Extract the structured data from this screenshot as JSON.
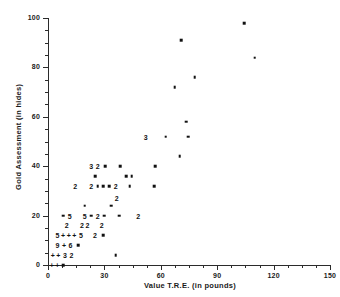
{
  "chart_data": {
    "type": "scatter",
    "title": "",
    "xlabel": "Value T.R.E. (in pounds)",
    "ylabel": "Gold Assessment (in hides)",
    "xlim": [
      0,
      150
    ],
    "ylim": [
      0,
      100
    ],
    "xticks": [
      0,
      30,
      60,
      90,
      120,
      150
    ],
    "yticks": [
      0,
      20,
      40,
      60,
      80,
      100
    ],
    "xtick_labels": [
      "0",
      "30",
      "60",
      "90",
      "120",
      "150"
    ],
    "ytick_labels": [
      "0",
      "20",
      "40",
      "60",
      "80",
      "100"
    ],
    "xminor_step": 7.5,
    "yminor_step": 5,
    "grid": false,
    "legend": null,
    "marker_note": "Digits and '+' glyphs mark positions where multiple observations coincide; a digit is the count of overlapping points and '+' marks a dense overlap.",
    "points": [
      {
        "x": 104.5,
        "y": 98,
        "label": "",
        "marker": "dot"
      },
      {
        "x": 71.0,
        "y": 91,
        "label": "",
        "marker": "dot"
      },
      {
        "x": 110.0,
        "y": 84,
        "label": "",
        "marker": "dot"
      },
      {
        "x": 78.0,
        "y": 76,
        "label": "",
        "marker": "dot"
      },
      {
        "x": 67.5,
        "y": 72,
        "label": "",
        "marker": "dot"
      },
      {
        "x": 73.5,
        "y": 58,
        "label": "",
        "marker": "dot"
      },
      {
        "x": 62.5,
        "y": 52,
        "label": "",
        "marker": "dot"
      },
      {
        "x": 74.5,
        "y": 52,
        "label": "",
        "marker": "dot"
      },
      {
        "x": 52.0,
        "y": 52,
        "label": "3",
        "marker": "count"
      },
      {
        "x": 70.0,
        "y": 44,
        "label": "",
        "marker": "dot"
      },
      {
        "x": 57.0,
        "y": 40,
        "label": "",
        "marker": "dot"
      },
      {
        "x": 23.0,
        "y": 40,
        "label": "3",
        "marker": "count"
      },
      {
        "x": 26.5,
        "y": 40,
        "label": "2",
        "marker": "count"
      },
      {
        "x": 30.5,
        "y": 40,
        "label": "",
        "marker": "dot"
      },
      {
        "x": 38.5,
        "y": 40,
        "label": "",
        "marker": "dot"
      },
      {
        "x": 25.0,
        "y": 36,
        "label": "",
        "marker": "dot"
      },
      {
        "x": 41.5,
        "y": 36,
        "label": "",
        "marker": "dot"
      },
      {
        "x": 44.5,
        "y": 36,
        "label": "",
        "marker": "dot"
      },
      {
        "x": 14.5,
        "y": 32,
        "label": "2",
        "marker": "count"
      },
      {
        "x": 23.0,
        "y": 32,
        "label": "2",
        "marker": "count"
      },
      {
        "x": 26.5,
        "y": 32,
        "label": "",
        "marker": "dot"
      },
      {
        "x": 29.5,
        "y": 32,
        "label": "",
        "marker": "dot"
      },
      {
        "x": 32.5,
        "y": 32,
        "label": "",
        "marker": "dot"
      },
      {
        "x": 36.0,
        "y": 32,
        "label": "2",
        "marker": "count"
      },
      {
        "x": 43.5,
        "y": 32,
        "label": "",
        "marker": "dot"
      },
      {
        "x": 56.5,
        "y": 32,
        "label": "",
        "marker": "dot"
      },
      {
        "x": 36.5,
        "y": 27,
        "label": "2",
        "marker": "count"
      },
      {
        "x": 19.5,
        "y": 24,
        "label": "",
        "marker": "dot"
      },
      {
        "x": 33.5,
        "y": 24,
        "label": "",
        "marker": "dot"
      },
      {
        "x": 8.0,
        "y": 20,
        "label": "",
        "marker": "dot"
      },
      {
        "x": 11.5,
        "y": 20,
        "label": "5",
        "marker": "count"
      },
      {
        "x": 19.5,
        "y": 20,
        "label": "5",
        "marker": "count"
      },
      {
        "x": 23.0,
        "y": 20,
        "label": "",
        "marker": "dot"
      },
      {
        "x": 26.5,
        "y": 20,
        "label": "2",
        "marker": "count"
      },
      {
        "x": 30.0,
        "y": 20,
        "label": "",
        "marker": "dot"
      },
      {
        "x": 38.0,
        "y": 20,
        "label": "",
        "marker": "dot"
      },
      {
        "x": 48.0,
        "y": 20,
        "label": "2",
        "marker": "count"
      },
      {
        "x": 10.0,
        "y": 16,
        "label": "2",
        "marker": "count"
      },
      {
        "x": 18.0,
        "y": 16,
        "label": "2",
        "marker": "count"
      },
      {
        "x": 21.0,
        "y": 16,
        "label": "2",
        "marker": "count"
      },
      {
        "x": 28.5,
        "y": 16,
        "label": "2",
        "marker": "count"
      },
      {
        "x": 5.0,
        "y": 12,
        "label": "5",
        "marker": "count"
      },
      {
        "x": 8.0,
        "y": 12,
        "label": "+",
        "marker": "plus"
      },
      {
        "x": 11.0,
        "y": 12,
        "label": "+",
        "marker": "plus"
      },
      {
        "x": 14.0,
        "y": 12,
        "label": "+",
        "marker": "plus"
      },
      {
        "x": 17.5,
        "y": 12,
        "label": "5",
        "marker": "count"
      },
      {
        "x": 25.0,
        "y": 12,
        "label": "2",
        "marker": "count"
      },
      {
        "x": 29.5,
        "y": 12,
        "label": "",
        "marker": "dot"
      },
      {
        "x": 5.0,
        "y": 8,
        "label": "9",
        "marker": "count"
      },
      {
        "x": 8.5,
        "y": 8,
        "label": "+",
        "marker": "plus"
      },
      {
        "x": 12.0,
        "y": 8,
        "label": "6",
        "marker": "count"
      },
      {
        "x": 16.0,
        "y": 8,
        "label": "",
        "marker": "dot"
      },
      {
        "x": 2.5,
        "y": 4,
        "label": "+",
        "marker": "plus"
      },
      {
        "x": 5.5,
        "y": 4,
        "label": "+",
        "marker": "plus"
      },
      {
        "x": 9.0,
        "y": 4,
        "label": "3",
        "marker": "count"
      },
      {
        "x": 12.5,
        "y": 4,
        "label": "2",
        "marker": "count"
      },
      {
        "x": 36.0,
        "y": 4,
        "label": "",
        "marker": "dot"
      },
      {
        "x": 2.0,
        "y": 0,
        "label": "+",
        "marker": "plus"
      },
      {
        "x": 5.0,
        "y": 0,
        "label": "+",
        "marker": "plus"
      },
      {
        "x": 8.0,
        "y": 0,
        "label": "",
        "marker": "dot"
      }
    ]
  },
  "colors": {
    "marker": "#111111",
    "axis": "#2b2b2b",
    "background": "#ffffff"
  }
}
